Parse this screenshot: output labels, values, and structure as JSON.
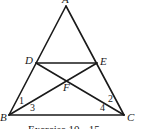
{
  "diagram": {
    "type": "geometry-triangle",
    "points": {
      "A": {
        "label": "A",
        "x": 66,
        "y": 6
      },
      "B": {
        "label": "B",
        "x": 9,
        "y": 115
      },
      "C": {
        "label": "C",
        "x": 124,
        "y": 115
      },
      "D": {
        "label": "D",
        "x": 36,
        "y": 63
      },
      "E": {
        "label": "E",
        "x": 97,
        "y": 63
      },
      "F": {
        "label": "F",
        "x": 67,
        "y": 81
      }
    },
    "segments": [
      "AB",
      "AC",
      "BC",
      "DE",
      "BE",
      "CD"
    ],
    "angle_labels": [
      "1",
      "2",
      "3",
      "4"
    ],
    "caption": "Exercise 10 - 15"
  }
}
